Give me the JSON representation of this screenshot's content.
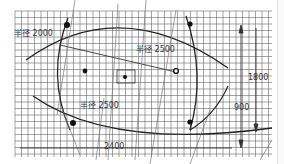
{
  "drawing": {
    "type": "technical grid drawing",
    "background": "#ffffff",
    "grid_color": "#555555",
    "line_color": "#222222",
    "grid": {
      "x0": 15,
      "y0": 11,
      "x1": 272,
      "y1": 157,
      "step": 6.5
    },
    "labels": {
      "radius_outer": "半径 2000",
      "radius_top": "半径 2500",
      "radius_bottom": "半径 2500",
      "dim_width": "2400",
      "dim_height_full": "1800",
      "dim_height_half": "900"
    },
    "markers": [
      {
        "name": "top-left-post",
        "x": 66,
        "y": 25
      },
      {
        "name": "top-right-post",
        "x": 190,
        "y": 24
      },
      {
        "name": "bottom-left-post",
        "x": 72,
        "y": 123
      },
      {
        "name": "bottom-right-post",
        "x": 190,
        "y": 122
      },
      {
        "name": "left-inner-dot",
        "x": 85,
        "y": 71
      },
      {
        "name": "right-inner-ring",
        "x": 176,
        "y": 71
      },
      {
        "name": "center-dot",
        "x": 125,
        "y": 76
      }
    ]
  }
}
